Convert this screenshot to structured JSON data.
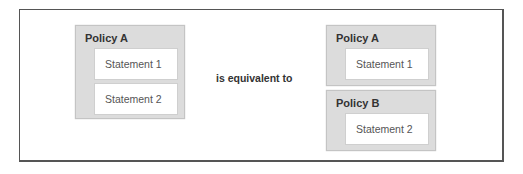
{
  "diagram": {
    "left": {
      "policy": {
        "title": "Policy A",
        "statements": [
          "Statement 1",
          "Statement 2"
        ]
      }
    },
    "connector": "is equivalent to",
    "right": {
      "policies": [
        {
          "title": "Policy A",
          "statements": [
            "Statement 1"
          ]
        },
        {
          "title": "Policy B",
          "statements": [
            "Statement 2"
          ]
        }
      ]
    }
  },
  "colors": {
    "policy_fill": "#dcdcdc",
    "statement_fill": "#ffffff",
    "frame_border": "#555555",
    "title_text": "#333333",
    "statement_text": "#555555"
  }
}
